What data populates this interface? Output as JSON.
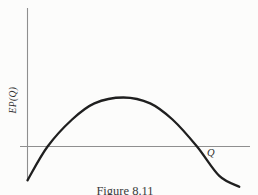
{
  "figure": {
    "caption": "Figure 8.11"
  },
  "chart_data": {
    "type": "line",
    "title": "Figure 8.11",
    "xlabel": "Q",
    "ylabel": "EP(Q)",
    "x": [
      0,
      0.9,
      2.0,
      3.0,
      4.3,
      5.5,
      6.5,
      7.6,
      8.6,
      9.5
    ],
    "y": [
      -0.69,
      0.0,
      0.55,
      0.88,
      1.0,
      0.88,
      0.55,
      0.0,
      -0.6,
      -0.82
    ],
    "xlim": [
      0,
      10
    ],
    "ylim": [
      -0.9,
      2.8
    ],
    "grid": false,
    "legend": false,
    "peak": {
      "x": 4.3,
      "y": 1.0
    },
    "zero_crossings_x": [
      0.9,
      7.6
    ],
    "series_name": "EP(Q) expected profit curve",
    "curve_color": "#1f1f1f",
    "axis_color": "#8f8f8f",
    "text_color": "#2b2b2b"
  }
}
